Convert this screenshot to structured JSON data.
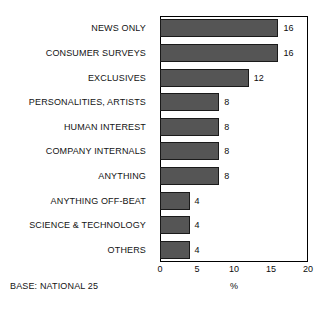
{
  "chart_data": {
    "type": "bar",
    "orientation": "horizontal",
    "title": "",
    "subtitle": "",
    "xlabel": "%",
    "ylabel": "",
    "xlim": [
      0,
      20
    ],
    "xticks": [
      0,
      5,
      10,
      15,
      20
    ],
    "xtick_labels": [
      "0",
      "5",
      "10",
      "15",
      "20"
    ],
    "grid": false,
    "legend": null,
    "categories": [
      "NEWS ONLY",
      "CONSUMER SURVEYS",
      "EXCLUSIVES",
      "PERSONALITIES, ARTISTS",
      "HUMAN INTEREST",
      "COMPANY INTERNALS",
      "ANYTHING",
      "ANYTHING OFF-BEAT",
      "SCIENCE & TECHNOLOGY",
      "OTHERS"
    ],
    "values": [
      16,
      16,
      12,
      8,
      8,
      8,
      8,
      4,
      4,
      4
    ],
    "value_labels": [
      "16",
      "16",
      "12",
      "8",
      "8",
      "8",
      "8",
      "4",
      "4",
      "4"
    ],
    "annotations": [
      "BASE: NATIONAL 25"
    ],
    "colors": {
      "bar_fill": "#555555",
      "bar_edge": "#1a1a1a",
      "axis": "#000000",
      "text": "#111111",
      "background": "#ffffff"
    }
  },
  "footnote": {
    "base_note": "BASE: NATIONAL 25"
  },
  "axis": {
    "unit_label": "%"
  }
}
